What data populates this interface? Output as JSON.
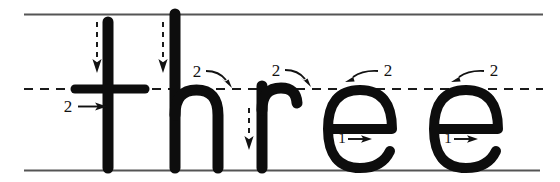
{
  "worksheet": {
    "title": "Handwriting practice: three",
    "word": "three",
    "letters": [
      "t",
      "h",
      "r",
      "e",
      "e"
    ],
    "ink_color": "#0d0d0d",
    "rule_color": "#555555",
    "background_color": "#ffffff",
    "guide_lines": {
      "top_label": "top-line",
      "mid_label": "mid-dashed-line",
      "base_label": "baseline",
      "top_y": 14,
      "mid_y": 89,
      "base_y": 170,
      "left_x": 24,
      "right_x": 543,
      "mid_style": "dashed",
      "top_style": "solid",
      "base_style": "solid"
    },
    "strokes": [
      {
        "letter": "t",
        "order": 1,
        "number_label": "",
        "arrow": "down",
        "arrow_style": "dashed",
        "description": "vertical stem from top line down to baseline"
      },
      {
        "letter": "t",
        "order": 2,
        "number_label": "2",
        "arrow": "right",
        "arrow_style": "solid",
        "description": "horizontal crossbar at mid line"
      },
      {
        "letter": "h",
        "order": 1,
        "number_label": "",
        "arrow": "down",
        "arrow_style": "dashed",
        "description": "tall ascender stem from top line to baseline"
      },
      {
        "letter": "h",
        "order": 2,
        "number_label": "2",
        "arrow": "curve-right",
        "arrow_style": "solid",
        "description": "arch up and over to the right, down to baseline"
      },
      {
        "letter": "r",
        "order": 1,
        "number_label": "",
        "arrow": "down",
        "arrow_style": "dashed",
        "description": "short stem from mid line to baseline"
      },
      {
        "letter": "r",
        "order": 2,
        "number_label": "2",
        "arrow": "curve-right",
        "arrow_style": "solid",
        "description": "small shoulder hook up and to the right"
      },
      {
        "letter": "e",
        "order": 1,
        "number_label": "1",
        "arrow": "right",
        "arrow_style": "solid",
        "description": "horizontal bar drawn left to right"
      },
      {
        "letter": "e",
        "order": 2,
        "number_label": "2",
        "arrow": "curve-left",
        "arrow_style": "solid",
        "description": "curve up and around counter-clockwise"
      },
      {
        "letter": "e",
        "order": 1,
        "number_label": "1",
        "arrow": "right",
        "arrow_style": "solid",
        "description": "horizontal bar drawn left to right"
      },
      {
        "letter": "e",
        "order": 2,
        "number_label": "2",
        "arrow": "curve-left",
        "arrow_style": "solid",
        "description": "curve up and around counter-clockwise"
      }
    ],
    "markers": {
      "t_stroke2_number": "2",
      "h_stroke2_number": "2",
      "r_stroke2_number": "2",
      "e1_stroke1_number": "1",
      "e1_stroke2_number": "2",
      "e2_stroke1_number": "1",
      "e2_stroke2_number": "2"
    }
  }
}
